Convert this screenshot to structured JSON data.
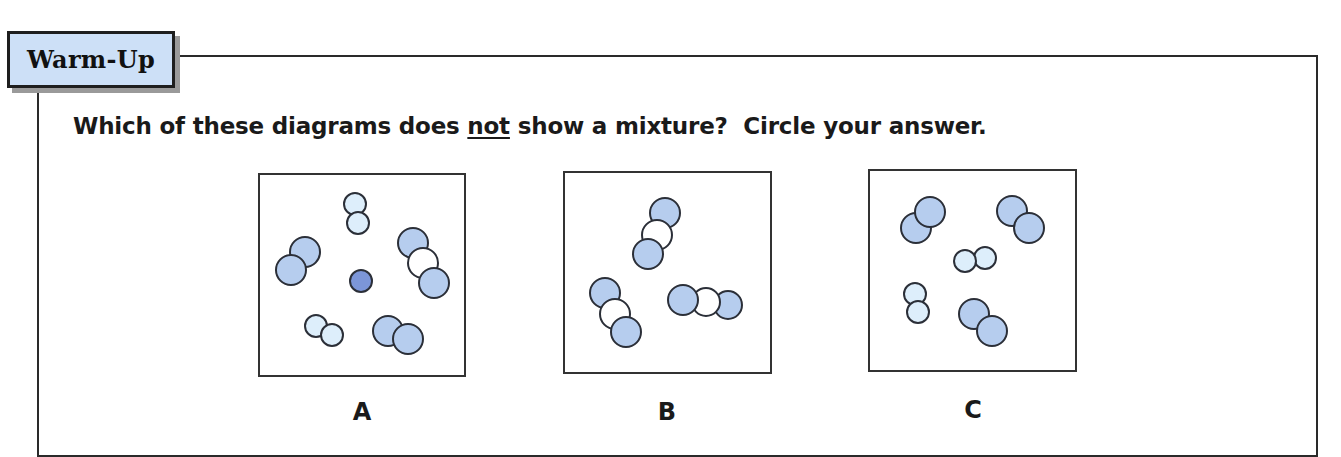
{
  "section": {
    "tab_label": "Warm-Up"
  },
  "question": {
    "prefix": "Which of these diagrams does ",
    "emphasis": "not",
    "suffix": " show a mixture?  Circle your answer."
  },
  "colors": {
    "tab_fill": "#cde0f7",
    "blue_atom": "#b6cdee",
    "pale_atom": "#ddeefb",
    "white_atom": "#ffffff",
    "dark_atom": "#7c96d8",
    "stroke": "#2b2f38"
  },
  "diagrams": [
    {
      "label": "A",
      "box": {
        "x": 258,
        "y": 173,
        "w": 208,
        "h": 204
      },
      "label_pos": {
        "x": 342,
        "y": 398
      },
      "atoms": [
        {
          "cx": 355,
          "cy": 204,
          "r": 11,
          "fill": "pale"
        },
        {
          "cx": 358,
          "cy": 223,
          "r": 11,
          "fill": "pale"
        },
        {
          "cx": 305,
          "cy": 252,
          "r": 15,
          "fill": "blue"
        },
        {
          "cx": 291,
          "cy": 270,
          "r": 15,
          "fill": "blue"
        },
        {
          "cx": 413,
          "cy": 243,
          "r": 15,
          "fill": "blue"
        },
        {
          "cx": 423,
          "cy": 263,
          "r": 15,
          "fill": "white"
        },
        {
          "cx": 434,
          "cy": 283,
          "r": 15,
          "fill": "blue"
        },
        {
          "cx": 361,
          "cy": 281,
          "r": 11,
          "fill": "dark"
        },
        {
          "cx": 316,
          "cy": 326,
          "r": 11,
          "fill": "pale"
        },
        {
          "cx": 332,
          "cy": 335,
          "r": 11,
          "fill": "pale"
        },
        {
          "cx": 388,
          "cy": 331,
          "r": 15,
          "fill": "blue"
        },
        {
          "cx": 408,
          "cy": 339,
          "r": 15,
          "fill": "blue"
        }
      ]
    },
    {
      "label": "B",
      "box": {
        "x": 563,
        "y": 171,
        "w": 209,
        "h": 203
      },
      "label_pos": {
        "x": 647,
        "y": 398
      },
      "atoms": [
        {
          "cx": 665,
          "cy": 213,
          "r": 15,
          "fill": "blue"
        },
        {
          "cx": 657,
          "cy": 235,
          "r": 15,
          "fill": "white"
        },
        {
          "cx": 648,
          "cy": 254,
          "r": 15,
          "fill": "blue"
        },
        {
          "cx": 605,
          "cy": 293,
          "r": 15,
          "fill": "blue"
        },
        {
          "cx": 615,
          "cy": 314,
          "r": 15,
          "fill": "white"
        },
        {
          "cx": 626,
          "cy": 332,
          "r": 15,
          "fill": "blue"
        },
        {
          "cx": 728,
          "cy": 305,
          "r": 14,
          "fill": "blue"
        },
        {
          "cx": 706,
          "cy": 302,
          "r": 14,
          "fill": "white"
        },
        {
          "cx": 683,
          "cy": 300,
          "r": 15,
          "fill": "blue"
        }
      ]
    },
    {
      "label": "C",
      "box": {
        "x": 868,
        "y": 169,
        "w": 209,
        "h": 203
      },
      "label_pos": {
        "x": 953,
        "y": 396
      },
      "atoms": [
        {
          "cx": 916,
          "cy": 228,
          "r": 15,
          "fill": "blue"
        },
        {
          "cx": 930,
          "cy": 212,
          "r": 15,
          "fill": "blue"
        },
        {
          "cx": 1012,
          "cy": 211,
          "r": 15,
          "fill": "blue"
        },
        {
          "cx": 1029,
          "cy": 228,
          "r": 15,
          "fill": "blue"
        },
        {
          "cx": 985,
          "cy": 258,
          "r": 11,
          "fill": "pale"
        },
        {
          "cx": 965,
          "cy": 261,
          "r": 11,
          "fill": "pale"
        },
        {
          "cx": 915,
          "cy": 294,
          "r": 11,
          "fill": "pale"
        },
        {
          "cx": 918,
          "cy": 312,
          "r": 11,
          "fill": "pale"
        },
        {
          "cx": 974,
          "cy": 314,
          "r": 15,
          "fill": "blue"
        },
        {
          "cx": 992,
          "cy": 331,
          "r": 15,
          "fill": "blue"
        }
      ]
    }
  ]
}
